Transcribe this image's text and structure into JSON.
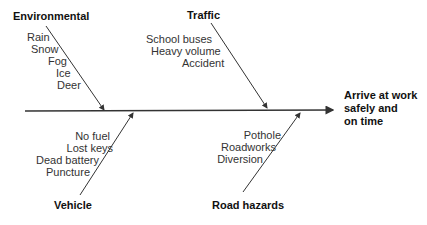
{
  "diagram": {
    "type": "fishbone",
    "effect": [
      "Arrive at work",
      "safely and",
      "on time"
    ],
    "categories": [
      {
        "name": "Environmental",
        "position": "top",
        "causes": [
          "Rain",
          "Snow",
          "Fog",
          "Ice",
          "Deer"
        ]
      },
      {
        "name": "Traffic",
        "position": "top",
        "causes": [
          "School buses",
          "Heavy volume",
          "Accident"
        ]
      },
      {
        "name": "Vehicle",
        "position": "bottom",
        "causes": [
          "No fuel",
          "Lost keys",
          "Dead battery",
          "Puncture"
        ]
      },
      {
        "name": "Road hazards",
        "position": "bottom",
        "causes": [
          "Pothole",
          "Roadworks",
          "Diversion"
        ]
      }
    ],
    "line_color": "#333333"
  }
}
